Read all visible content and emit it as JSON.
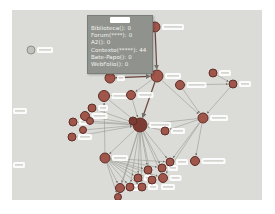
{
  "window": {
    "bg": "#ffffff"
  },
  "canvas": {
    "x": 12,
    "y": 10,
    "w": 250,
    "h": 190,
    "bg": "#dbdbd8"
  },
  "tooltip": {
    "x": 75,
    "y": 5,
    "w": 66,
    "h": 59,
    "bg": "#8f928d",
    "border": "#7b7f79",
    "text_color": "#f4f4f1",
    "title": "",
    "lines": [
      "Biblioteca(): 0",
      "Forum(****): 0",
      "A2(): 0",
      "Contexto(*****): 44",
      "Bate-Papo(): 0",
      "WebFolio(): 0"
    ]
  },
  "graph": {
    "style": {
      "node_fill": "#a0564a",
      "node_stroke": "#5e2f28",
      "hub_fill": "#7c3c34",
      "light_fill": "#c2c1bb",
      "light_stroke": "#8f8e88",
      "edge_color": "#9a9a92",
      "edge_dark_color": "#6e4b42",
      "arrow_color": "#72726b",
      "label_fill": "#ffffff"
    },
    "nodes": [
      {
        "id": "n1",
        "x": 143,
        "y": 17,
        "r": 5,
        "label_w": 22
      },
      {
        "id": "n2",
        "x": 145,
        "y": 66,
        "r": 6,
        "label_w": 16
      },
      {
        "id": "n3",
        "x": 98,
        "y": 68,
        "r": 5,
        "label_w": 8
      },
      {
        "id": "n4",
        "x": 19,
        "y": 40,
        "r": 4,
        "light": true,
        "label_w": 16
      },
      {
        "id": "n5",
        "x": 201,
        "y": 63,
        "r": 4,
        "label_w": 12
      },
      {
        "id": "n6",
        "x": 168,
        "y": 75,
        "r": 4.5,
        "label_w": 20
      },
      {
        "id": "n7",
        "x": 221,
        "y": 74,
        "r": 4,
        "label_w": 12
      },
      {
        "id": "n8",
        "x": 191,
        "y": 108,
        "r": 5,
        "label_w": 18
      },
      {
        "id": "n9",
        "x": 153,
        "y": 121,
        "r": 4,
        "label_w": 14
      },
      {
        "id": "n10",
        "x": 119,
        "y": 85,
        "r": 4.5,
        "label_w": 16
      },
      {
        "id": "n11",
        "x": 92,
        "y": 86,
        "r": 5.5,
        "label_w": 18
      },
      {
        "id": "n12",
        "x": 80,
        "y": 98,
        "r": 4,
        "label_w": 10
      },
      {
        "id": "n13",
        "x": 73,
        "y": 106,
        "r": 4.5,
        "label_w": 16
      },
      {
        "id": "n14",
        "x": 61,
        "y": 112,
        "r": 4,
        "label_w": 14
      },
      {
        "id": "n15",
        "x": 78,
        "y": 111,
        "r": 3.5,
        "label_w": 0
      },
      {
        "id": "n16",
        "x": 60,
        "y": 127,
        "r": 4,
        "label_w": 14
      },
      {
        "id": "n17",
        "x": 71,
        "y": 120,
        "r": 3.5,
        "label_w": 0
      },
      {
        "id": "n18",
        "x": 128,
        "y": 115,
        "r": 7,
        "hub": true,
        "label_w": 22
      },
      {
        "id": "n19",
        "x": 121,
        "y": 111,
        "r": 4,
        "hub": true,
        "label_w": 0
      },
      {
        "id": "n20",
        "x": 93,
        "y": 148,
        "r": 5,
        "label_w": 16
      },
      {
        "id": "n21",
        "x": 136,
        "y": 160,
        "r": 4,
        "label_w": 0
      },
      {
        "id": "n22",
        "x": 150,
        "y": 158,
        "r": 4,
        "label_w": 10
      },
      {
        "id": "n23",
        "x": 158,
        "y": 152,
        "r": 4,
        "label_w": 12
      },
      {
        "id": "n24",
        "x": 183,
        "y": 151,
        "r": 4.5,
        "label_w": 24
      },
      {
        "id": "n25",
        "x": 151,
        "y": 168,
        "r": 4.5,
        "label_w": 12
      },
      {
        "id": "n26",
        "x": 140,
        "y": 170,
        "r": 4,
        "label_w": 0
      },
      {
        "id": "n27",
        "x": 126,
        "y": 168,
        "r": 4,
        "label_w": 10
      },
      {
        "id": "n28",
        "x": 108,
        "y": 178,
        "r": 4.5,
        "label_w": 12
      },
      {
        "id": "n29",
        "x": 118,
        "y": 177,
        "r": 4,
        "label_w": 0
      },
      {
        "id": "n30",
        "x": 130,
        "y": 177,
        "r": 4,
        "label_w": 10
      },
      {
        "id": "n31",
        "x": 106,
        "y": 187,
        "r": 3.5,
        "label_w": 0
      }
    ],
    "edges": [
      {
        "from": "n1",
        "to": "n2",
        "dark": true
      },
      {
        "from": "n3",
        "to": "n2",
        "dark": true
      },
      {
        "from": "n2",
        "to": "n18",
        "dark": true
      },
      {
        "from": "n2",
        "to": "n8"
      },
      {
        "from": "n2",
        "to": "n10"
      },
      {
        "from": "n5",
        "to": "n7"
      },
      {
        "from": "n6",
        "to": "n7"
      },
      {
        "from": "n6",
        "to": "n8"
      },
      {
        "from": "n7",
        "to": "n8"
      },
      {
        "from": "n8",
        "to": "n9"
      },
      {
        "from": "n8",
        "to": "n18"
      },
      {
        "from": "n8",
        "to": "n24"
      },
      {
        "from": "n8",
        "to": "n25"
      },
      {
        "from": "n8",
        "to": "n23"
      },
      {
        "from": "n10",
        "to": "n11"
      },
      {
        "from": "n10",
        "to": "n18"
      },
      {
        "from": "n11",
        "to": "n18"
      },
      {
        "from": "n12",
        "to": "n18"
      },
      {
        "from": "n13",
        "to": "n18"
      },
      {
        "from": "n14",
        "to": "n18"
      },
      {
        "from": "n15",
        "to": "n18"
      },
      {
        "from": "n16",
        "to": "n18"
      },
      {
        "from": "n17",
        "to": "n18"
      },
      {
        "from": "n9",
        "to": "n18"
      },
      {
        "from": "n18",
        "to": "n20"
      },
      {
        "from": "n18",
        "to": "n21"
      },
      {
        "from": "n18",
        "to": "n22"
      },
      {
        "from": "n18",
        "to": "n23"
      },
      {
        "from": "n18",
        "to": "n25"
      },
      {
        "from": "n18",
        "to": "n26"
      },
      {
        "from": "n18",
        "to": "n27"
      },
      {
        "from": "n18",
        "to": "n28"
      },
      {
        "from": "n18",
        "to": "n29"
      },
      {
        "from": "n18",
        "to": "n30"
      },
      {
        "from": "n18",
        "to": "n31"
      },
      {
        "from": "n20",
        "to": "n11"
      },
      {
        "from": "n20",
        "to": "n21"
      },
      {
        "from": "n20",
        "to": "n22"
      },
      {
        "from": "n20",
        "to": "n23"
      },
      {
        "from": "n20",
        "to": "n25"
      },
      {
        "from": "n20",
        "to": "n26"
      },
      {
        "from": "n20",
        "to": "n27"
      },
      {
        "from": "n20",
        "to": "n28"
      },
      {
        "from": "n20",
        "to": "n29"
      },
      {
        "from": "n20",
        "to": "n30"
      },
      {
        "from": "n20",
        "to": "n31"
      }
    ],
    "floating_labels": [
      {
        "x": 1,
        "y": 98,
        "w": 14
      },
      {
        "x": 1,
        "y": 152,
        "w": 12
      },
      {
        "x": 149,
        "y": 174,
        "w": 14
      }
    ]
  }
}
